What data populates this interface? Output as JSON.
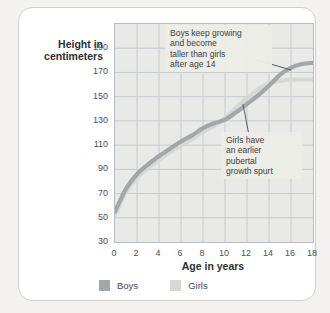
{
  "chart_data": {
    "type": "line",
    "ylabel": "Height in\ncentimeters",
    "xlabel": "Age in years",
    "x": [
      0,
      1,
      2,
      3,
      4,
      5,
      6,
      7,
      8,
      9,
      10,
      11,
      12,
      13,
      14,
      15,
      16,
      17,
      18
    ],
    "series": [
      {
        "name": "Boys",
        "color": "#a4a7a9",
        "values": [
          55,
          74,
          86,
          94,
          101,
          107,
          113,
          118,
          124,
          128,
          131,
          137,
          144,
          151,
          159,
          168,
          174,
          177,
          178
        ]
      },
      {
        "name": "Girls",
        "color": "#d7d8d3",
        "values": [
          52,
          71,
          83,
          91,
          98,
          104,
          110,
          115,
          121,
          126,
          132,
          141,
          149,
          156,
          161,
          163,
          164,
          164,
          164
        ]
      }
    ],
    "xlim": [
      0,
      18
    ],
    "ylim": [
      30,
      210
    ],
    "xticks": [
      0,
      2,
      4,
      6,
      8,
      10,
      12,
      14,
      16,
      18
    ],
    "yticks": [
      30,
      50,
      70,
      90,
      110,
      130,
      150,
      170,
      190
    ],
    "grid": true,
    "gridline_color": "#c6cbd0",
    "plot_bg": "#e9e9e7",
    "legend_position": "bottom",
    "annotations": [
      {
        "id": "boys-note",
        "text": "Boys keep growing\nand become\ntaller than girls\nafter age 14",
        "box": {
          "left": 146,
          "top": 17,
          "width": 97
        },
        "leader": {
          "x1": 142,
          "y1": 36,
          "x2": 176,
          "y2": 46
        }
      },
      {
        "id": "girls-note",
        "text": "Girls have\nan earlier\npubertal\ngrowth spurt",
        "box": {
          "left": 202,
          "top": 124,
          "width": 71
        },
        "leader": {
          "x1": 134,
          "y1": 111,
          "x2": 128,
          "y2": 80
        }
      }
    ],
    "leader_color": "#5a5d5f"
  },
  "legend": {
    "items": [
      {
        "label": "Boys",
        "color": "#a4a7a9"
      },
      {
        "label": "Girls",
        "color": "#d7d8d3"
      }
    ]
  }
}
